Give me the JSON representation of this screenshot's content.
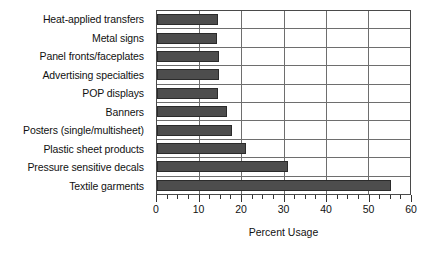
{
  "chart_data": {
    "type": "bar",
    "orientation": "horizontal",
    "title": "",
    "xlabel": "Percent Usage",
    "ylabel": "",
    "xlim": [
      0,
      60
    ],
    "xticks": [
      0,
      10,
      20,
      30,
      40,
      50,
      60
    ],
    "minor_tick_step": 2.5,
    "grid": true,
    "grid_axis": "both",
    "legend": false,
    "bar_color": "#4d4d4d",
    "bar_edge_color": "#2b2b2b",
    "categories": [
      "Heat-applied transfers",
      "Metal signs",
      "Panel fronts/faceplates",
      "Advertising specialties",
      "POP displays",
      "Banners",
      "Posters (single/multisheet)",
      "Plastic sheet products",
      "Pressure sensitive decals",
      "Textile garments"
    ],
    "values": [
      14.4,
      14.2,
      14.8,
      14.6,
      14.5,
      16.7,
      17.7,
      21.2,
      31.1,
      55.4
    ]
  }
}
